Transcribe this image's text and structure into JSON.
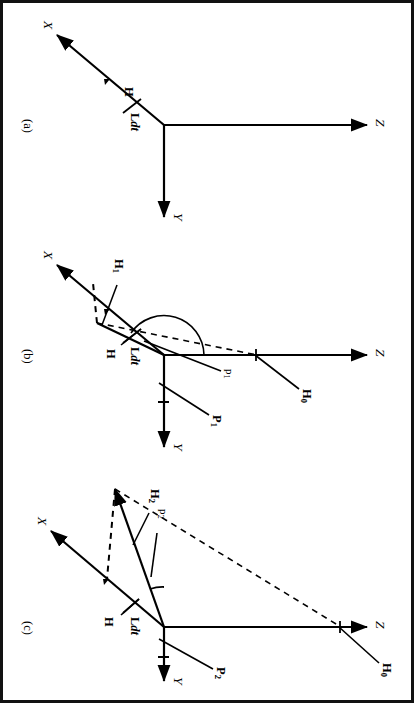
{
  "figure": {
    "kind": "three-panel vector diagram",
    "border_color": "#111111",
    "line_color": "#000000",
    "background": "#ffffff"
  },
  "panels": [
    {
      "id": "a",
      "caption": "(a)",
      "axes": {
        "x": "X",
        "y": "Y",
        "z": "Z"
      },
      "labels": {
        "h": "H",
        "ldt_bold": "L",
        "ldt_italic": "dt"
      }
    },
    {
      "id": "b",
      "caption": "(b)",
      "axes": {
        "x": "X",
        "y": "Y",
        "z": "Z"
      },
      "labels": {
        "h": "H",
        "ldt_bold": "L",
        "ldt_italic": "dt",
        "h0": "H",
        "h0_sub": "0",
        "h1": "H",
        "h1_sub": "1",
        "p1_bold": "P",
        "p1_bold_sub": "1",
        "p1_angle": "p",
        "p1_angle_sub": "1"
      }
    },
    {
      "id": "c",
      "caption": "(c)",
      "axes": {
        "x": "X",
        "y": "Y",
        "z": "Z"
      },
      "labels": {
        "h": "H",
        "ldt_bold": "L",
        "ldt_italic": "dt",
        "h0": "H",
        "h0_sub": "0",
        "h2": "H",
        "h2_sub": "2",
        "p2_bold": "P",
        "p2_bold_sub": "2",
        "p2_angle": "p",
        "p2_angle_sub": "2"
      }
    }
  ]
}
